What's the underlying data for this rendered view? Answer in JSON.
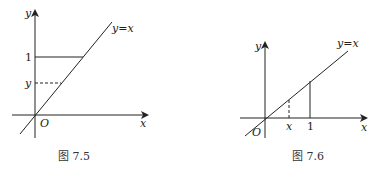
{
  "figures": [
    {
      "id": "fig-7-5",
      "caption": "图 7.5",
      "axis_x_label": "x",
      "axis_y_label": "y",
      "origin_label": "O",
      "line_label": "y=x",
      "tick_y_solid": "1",
      "tick_y_dashed": "y"
    },
    {
      "id": "fig-7-6",
      "caption": "图 7.6",
      "axis_x_label": "x",
      "axis_y_label": "y",
      "origin_label": "O",
      "line_label": "y=x",
      "tick_x_dashed": "x",
      "tick_x_solid": "1"
    }
  ]
}
